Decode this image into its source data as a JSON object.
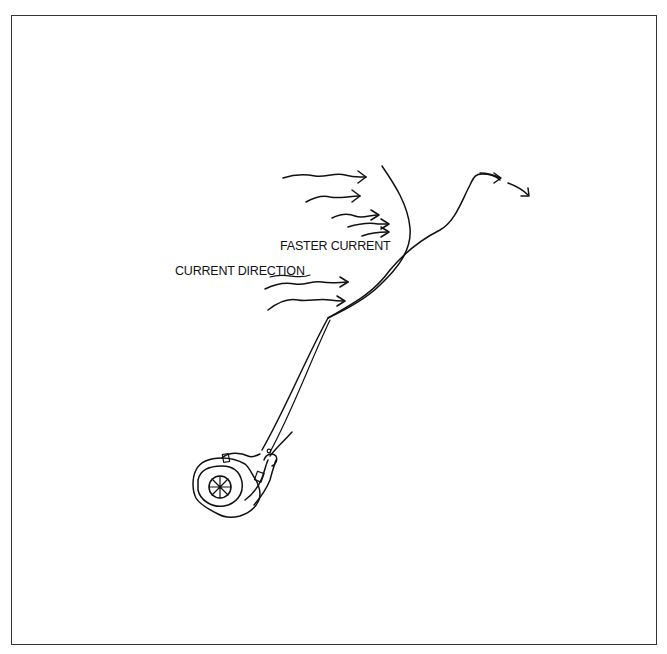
{
  "diagram": {
    "type": "line-drawing",
    "labels": {
      "faster_current": "FASTER CURRENT",
      "current_direction": "CURRENT DIRECTION"
    },
    "elements": [
      {
        "name": "angler",
        "description": "Person viewed from above wearing a hat, holding a rod"
      },
      {
        "name": "fishing-line",
        "description": "Line running from angler up to the current seam and downstream"
      },
      {
        "name": "current-seam",
        "description": "Curved line marking the edge of the faster current"
      },
      {
        "name": "current-arrows",
        "count": 7,
        "description": "Wavy arrows pointing right showing current direction"
      },
      {
        "name": "drift-arrows",
        "count": 2,
        "description": "Arrows at end of line showing downstream drift"
      }
    ],
    "colors": {
      "stroke": "#111111",
      "background": "#ffffff",
      "frame": "#333333"
    }
  }
}
